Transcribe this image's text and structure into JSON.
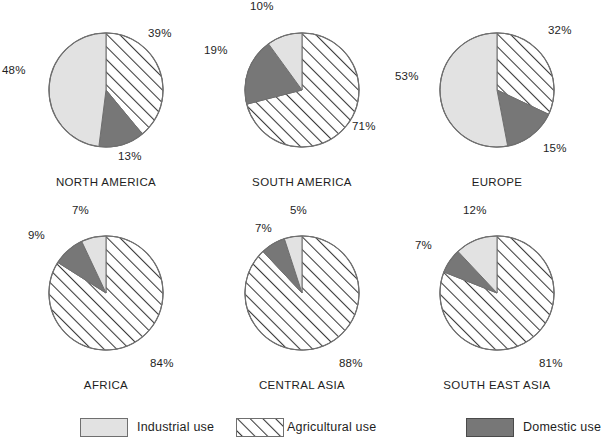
{
  "figure": {
    "title": "",
    "background_color": "#ffffff",
    "text_color": "#1e1e1e"
  },
  "colors": {
    "industrial": "#e2e2e2",
    "agricultural": "#ffffff",
    "domestic": "#777777",
    "outline": "#6f6f6f",
    "hatch_line": "#3a3a3a"
  },
  "legend": {
    "items": [
      {
        "key": "industrial",
        "label": "Industrial use",
        "swatch": "industrial-swatch"
      },
      {
        "key": "agricultural",
        "label": "Agricultural use",
        "swatch": "agricultural-swatch"
      },
      {
        "key": "domestic",
        "label": "Domestic use",
        "swatch": "domestic-swatch"
      }
    ]
  },
  "corner": {
    "mark": ""
  },
  "chart_data": [
    {
      "type": "pie",
      "title": "NORTH AMERICA",
      "categories": [
        "Agricultural use",
        "Domestic use",
        "Industrial use"
      ],
      "values": [
        39,
        13,
        48
      ],
      "labels": [
        "39%",
        "13%",
        "48%"
      ],
      "start_angle": 0,
      "direction": "clockwise",
      "xlabel": "",
      "ylabel": ""
    },
    {
      "type": "pie",
      "title": "SOUTH AMERICA",
      "categories": [
        "Agricultural use",
        "Domestic use",
        "Industrial use"
      ],
      "values": [
        71,
        19,
        10
      ],
      "labels": [
        "71%",
        "19%",
        "10%"
      ],
      "start_angle": 0,
      "direction": "clockwise",
      "xlabel": "",
      "ylabel": ""
    },
    {
      "type": "pie",
      "title": "EUROPE",
      "categories": [
        "Agricultural use",
        "Domestic use",
        "Industrial use"
      ],
      "values": [
        32,
        15,
        53
      ],
      "labels": [
        "32%",
        "15%",
        "53%"
      ],
      "start_angle": 0,
      "direction": "clockwise",
      "xlabel": "",
      "ylabel": ""
    },
    {
      "type": "pie",
      "title": "AFRICA",
      "categories": [
        "Agricultural use",
        "Domestic use",
        "Industrial use"
      ],
      "values": [
        84,
        9,
        7
      ],
      "labels": [
        "84%",
        "9%",
        "7%"
      ],
      "start_angle": 0,
      "direction": "clockwise",
      "xlabel": "",
      "ylabel": ""
    },
    {
      "type": "pie",
      "title": "CENTRAL ASIA",
      "categories": [
        "Agricultural use",
        "Domestic use",
        "Industrial use"
      ],
      "values": [
        88,
        7,
        5
      ],
      "labels": [
        "88%",
        "7%",
        "5%"
      ],
      "start_angle": 0,
      "direction": "clockwise",
      "xlabel": "",
      "ylabel": ""
    },
    {
      "type": "pie",
      "title": "SOUTH EAST ASIA",
      "categories": [
        "Agricultural use",
        "Domestic use",
        "Industrial use"
      ],
      "values": [
        81,
        7,
        12
      ],
      "labels": [
        "81%",
        "7%",
        "12%"
      ],
      "start_angle": 0,
      "direction": "clockwise",
      "xlabel": "",
      "ylabel": ""
    }
  ],
  "layout": {
    "cells": [
      {
        "left": 10,
        "top": 2,
        "label_offsets": [
          [
            138,
            25
          ],
          [
            108,
            148
          ],
          [
            -8,
            62
          ]
        ]
      },
      {
        "left": 206,
        "top": 2,
        "label_offsets": [
          [
            146,
            118
          ],
          [
            -2,
            142
          ],
          [
            44,
            -5
          ]
        ]
      },
      {
        "left": 401,
        "top": 2,
        "label_offsets": [
          [
            146,
            22
          ],
          [
            142,
            140
          ],
          [
            -6,
            68
          ]
        ]
      },
      {
        "left": 10,
        "top": 205,
        "label_offsets": [
          [
            140,
            155
          ],
          [
            6,
            28
          ],
          [
            52,
            -4
          ]
        ]
      },
      {
        "left": 206,
        "top": 205,
        "label_offsets": [
          [
            134,
            155
          ],
          [
            6,
            25
          ],
          [
            58,
            -4
          ]
        ]
      },
      {
        "left": 401,
        "top": 205,
        "label_offsets": [
          [
            138,
            155
          ],
          [
            2,
            35
          ],
          [
            48,
            -4
          ]
        ]
      }
    ],
    "legend_positions": [
      80,
      236,
      466
    ]
  }
}
